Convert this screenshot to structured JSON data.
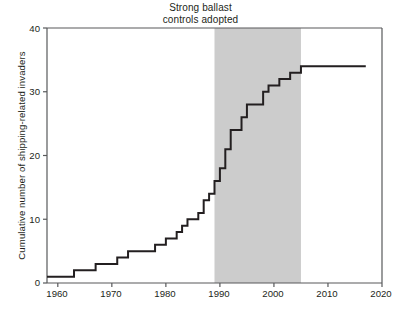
{
  "chart_data": {
    "type": "line",
    "title": "",
    "annotation": {
      "line1": "Strong ballast",
      "line2": "controls adopted",
      "span_start": 1989,
      "span_end": 2005,
      "shade_color": "#cccccc"
    },
    "xlabel": "",
    "ylabel": "Cumulative number of shipping-related invaders",
    "xlim": [
      1958,
      2020
    ],
    "ylim": [
      0,
      40
    ],
    "xticks": [
      1960,
      1970,
      1980,
      1990,
      2000,
      2010,
      2020
    ],
    "xtick_labels": [
      "1960",
      "1970",
      "1980",
      "1990",
      "2000",
      "2010",
      "2020"
    ],
    "yticks": [
      0,
      10,
      20,
      30,
      40
    ],
    "ytick_labels": [
      "0",
      "10",
      "20",
      "30",
      "40"
    ],
    "grid": false,
    "legend": false,
    "line_color": "#231f20",
    "line_width": 2,
    "series": [
      {
        "name": "Cumulative shipping-related invaders",
        "x": [
          1958,
          1962,
          1963,
          1966,
          1967,
          1970,
          1971,
          1972,
          1973,
          1977,
          1978,
          1979,
          1980,
          1981,
          1982,
          1983,
          1984,
          1985,
          1986,
          1987,
          1988,
          1989,
          1990,
          1991,
          1992,
          1993,
          1994,
          1995,
          1996,
          1997,
          1998,
          1999,
          2000,
          2001,
          2002,
          2003,
          2004,
          2005,
          2017
        ],
        "y": [
          1,
          1,
          2,
          2,
          3,
          3,
          4,
          4,
          5,
          5,
          6,
          6,
          7,
          7,
          8,
          9,
          10,
          10,
          11,
          13,
          14,
          16,
          18,
          21,
          24,
          24,
          26,
          28,
          28,
          28,
          30,
          31,
          31,
          32,
          32,
          33,
          33,
          34,
          34
        ]
      }
    ]
  }
}
